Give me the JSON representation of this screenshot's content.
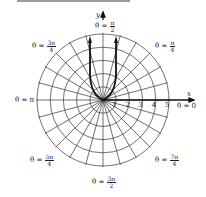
{
  "diagram": {
    "type": "polar_graph",
    "axes": {
      "x_label": "x",
      "y_label": "y"
    },
    "radial_ticks": [
      "1",
      "2",
      "3",
      "4",
      "5"
    ],
    "angle_labels": [
      {
        "id": "a0",
        "prefix": "θ = ",
        "text": "0"
      },
      {
        "id": "a1",
        "prefix": "θ = ",
        "num": "π",
        "den": "4"
      },
      {
        "id": "a2",
        "prefix": "θ = ",
        "num": "π",
        "den": "2"
      },
      {
        "id": "a3",
        "prefix": "θ = ",
        "num": "3π",
        "den": "4"
      },
      {
        "id": "a4",
        "prefix": "θ = ",
        "text": "π"
      },
      {
        "id": "a5",
        "prefix": "θ = ",
        "num": "5π",
        "den": "4"
      },
      {
        "id": "a6",
        "prefix": "θ = ",
        "num": "3π",
        "den": "2"
      },
      {
        "id": "a7",
        "prefix": "θ = ",
        "num": "7π",
        "den": "4"
      }
    ],
    "grid": {
      "circles": 5,
      "radial_lines": 24,
      "line_color": "#333333"
    },
    "curve": {
      "description": "U-shaped curve through origin opening upward with arrowheads",
      "color": "#111111"
    }
  }
}
